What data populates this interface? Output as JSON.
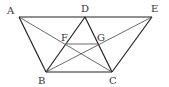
{
  "diagram": {
    "type": "geometry",
    "points": {
      "A": {
        "label": "A",
        "x": 19,
        "y": 17
      },
      "D": {
        "label": "D",
        "x": 85,
        "y": 17
      },
      "E": {
        "label": "E",
        "x": 152,
        "y": 17
      },
      "B": {
        "label": "B",
        "x": 46,
        "y": 72
      },
      "C": {
        "label": "C",
        "x": 112,
        "y": 72
      },
      "F": {
        "label": "F",
        "x": 67,
        "y": 44
      },
      "G": {
        "label": "G",
        "x": 98,
        "y": 44
      }
    },
    "segments": [
      "AE",
      "AB",
      "BC",
      "CE",
      "BD",
      "DC",
      "AC",
      "BE",
      "FG"
    ]
  }
}
